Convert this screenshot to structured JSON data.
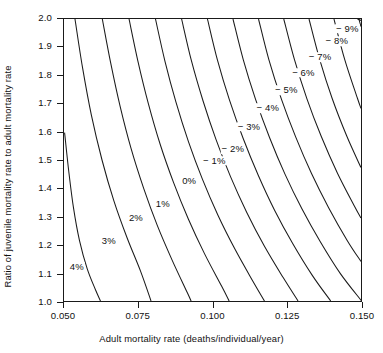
{
  "chart_data": {
    "type": "line",
    "subtype": "contour",
    "title": "",
    "xlabel": "Adult mortality rate (deaths/individual/year)",
    "ylabel": "Ratio of juvenile mortality rate to adult mortality rate",
    "xlim": [
      0.05,
      0.15
    ],
    "ylim": [
      1.0,
      2.0
    ],
    "grid": false,
    "legend": "none",
    "xticks": [
      "0.050",
      "0.075",
      "0.100",
      "0.125",
      "0.150"
    ],
    "xtick_values": [
      0.05,
      0.075,
      0.1,
      0.125,
      0.15
    ],
    "yticks": [
      "1.0",
      "1.1",
      "1.2",
      "1.3",
      "1.4",
      "1.5",
      "1.6",
      "1.7",
      "1.8",
      "1.9",
      "2.0"
    ],
    "ytick_values": [
      1.0,
      1.1,
      1.2,
      1.3,
      1.4,
      1.5,
      1.6,
      1.7,
      1.8,
      1.9,
      2.0
    ],
    "contour_levels": [
      4,
      3,
      2,
      1,
      0,
      -1,
      -2,
      -3,
      -4,
      -5,
      -6,
      -7,
      -8,
      -9
    ],
    "contour_unit": "%",
    "line_color": "#1a1a1a",
    "axis_color": "#1a1a1a",
    "background_color": "#ffffff",
    "contours": [
      {
        "level": 4,
        "label": "4%",
        "label_x": 0.0546,
        "label_y": 1.125,
        "label_side": "right",
        "points": [
          [
            0.0502,
            1.597
          ],
          [
            0.0516,
            1.46
          ],
          [
            0.0532,
            1.33
          ],
          [
            0.0552,
            1.215
          ],
          [
            0.0578,
            1.115
          ],
          [
            0.0606,
            1.04
          ],
          [
            0.0623,
            1.0
          ]
        ]
      },
      {
        "level": 3,
        "label": "3%",
        "label_x": 0.0653,
        "label_y": 1.215,
        "label_side": "right",
        "points": [
          [
            0.0537,
            2.0
          ],
          [
            0.0562,
            1.83
          ],
          [
            0.0592,
            1.66
          ],
          [
            0.0628,
            1.5
          ],
          [
            0.0668,
            1.355
          ],
          [
            0.0712,
            1.225
          ],
          [
            0.0758,
            1.105
          ],
          [
            0.0793,
            1.0
          ]
        ]
      },
      {
        "level": 2,
        "label": "2%",
        "label_x": 0.0744,
        "label_y": 1.295,
        "label_side": "right",
        "points": [
          [
            0.0629,
            2.0
          ],
          [
            0.0657,
            1.845
          ],
          [
            0.0689,
            1.69
          ],
          [
            0.0726,
            1.54
          ],
          [
            0.0768,
            1.4
          ],
          [
            0.0814,
            1.268
          ],
          [
            0.0864,
            1.145
          ],
          [
            0.0915,
            1.03
          ],
          [
            0.0928,
            1.0
          ]
        ]
      },
      {
        "level": 1,
        "label": "1%",
        "label_x": 0.0834,
        "label_y": 1.345,
        "label_side": "right",
        "points": [
          [
            0.0719,
            2.0
          ],
          [
            0.0749,
            1.85
          ],
          [
            0.0784,
            1.7
          ],
          [
            0.0824,
            1.555
          ],
          [
            0.0869,
            1.42
          ],
          [
            0.0919,
            1.29
          ],
          [
            0.0973,
            1.168
          ],
          [
            0.1031,
            1.052
          ],
          [
            0.1056,
            1.0
          ]
        ]
      },
      {
        "level": 0,
        "label": "0%",
        "label_x": 0.0922,
        "label_y": 1.425,
        "label_side": "right",
        "points": [
          [
            0.0808,
            2.0
          ],
          [
            0.084,
            1.85
          ],
          [
            0.0877,
            1.705
          ],
          [
            0.0919,
            1.565
          ],
          [
            0.0966,
            1.432
          ],
          [
            0.1018,
            1.305
          ],
          [
            0.1075,
            1.185
          ],
          [
            0.1136,
            1.07
          ],
          [
            0.1175,
            1.0
          ]
        ]
      },
      {
        "level": -1,
        "label": "− 1%",
        "label_x": 0.1006,
        "label_y": 1.497,
        "label_side": "left",
        "points": [
          [
            0.0896,
            2.0
          ],
          [
            0.0929,
            1.852
          ],
          [
            0.0968,
            1.71
          ],
          [
            0.1012,
            1.572
          ],
          [
            0.1061,
            1.44
          ],
          [
            0.1115,
            1.315
          ],
          [
            0.1174,
            1.196
          ],
          [
            0.1238,
            1.083
          ],
          [
            0.1288,
            1.0
          ]
        ]
      },
      {
        "level": -2,
        "label": "− 2%",
        "label_x": 0.1068,
        "label_y": 1.538,
        "label_side": "left",
        "points": [
          [
            0.0983,
            2.0
          ],
          [
            0.1017,
            1.853
          ],
          [
            0.1057,
            1.713
          ],
          [
            0.1103,
            1.577
          ],
          [
            0.1154,
            1.446
          ],
          [
            0.1209,
            1.322
          ],
          [
            0.127,
            1.204
          ],
          [
            0.1336,
            1.091
          ],
          [
            0.1398,
            1.0
          ]
        ]
      },
      {
        "level": -3,
        "label": "− 3%",
        "label_x": 0.1122,
        "label_y": 1.617,
        "label_side": "left",
        "points": [
          [
            0.1069,
            2.0
          ],
          [
            0.1104,
            1.854
          ],
          [
            0.1145,
            1.715
          ],
          [
            0.1192,
            1.58
          ],
          [
            0.1244,
            1.45
          ],
          [
            0.1301,
            1.327
          ],
          [
            0.1363,
            1.21
          ],
          [
            0.143,
            1.098
          ],
          [
            0.1502,
            1.0
          ]
        ]
      },
      {
        "level": -4,
        "label": "− 4%",
        "label_x": 0.1185,
        "label_y": 1.682,
        "label_side": "left",
        "points": [
          [
            0.1155,
            2.0
          ],
          [
            0.119,
            1.855
          ],
          [
            0.1232,
            1.716
          ],
          [
            0.128,
            1.582
          ],
          [
            0.1333,
            1.453
          ],
          [
            0.1391,
            1.331
          ],
          [
            0.1454,
            1.214
          ],
          [
            0.15,
            1.14
          ]
        ]
      },
      {
        "level": -5,
        "label": "− 5%",
        "label_x": 0.1247,
        "label_y": 1.745,
        "label_side": "left",
        "points": [
          [
            0.124,
            2.0
          ],
          [
            0.1276,
            1.856
          ],
          [
            0.1318,
            1.717
          ],
          [
            0.1366,
            1.584
          ],
          [
            0.142,
            1.455
          ],
          [
            0.1479,
            1.334
          ],
          [
            0.15,
            1.294
          ]
        ]
      },
      {
        "level": -6,
        "label": "− 6%",
        "label_x": 0.1304,
        "label_y": 1.807,
        "label_side": "left",
        "points": [
          [
            0.1325,
            2.0
          ],
          [
            0.1361,
            1.856
          ],
          [
            0.1403,
            1.718
          ],
          [
            0.1452,
            1.585
          ],
          [
            0.15,
            1.473
          ]
        ]
      },
      {
        "level": -7,
        "label": "− 7%",
        "label_x": 0.136,
        "label_y": 1.862,
        "label_side": "left",
        "points": [
          [
            0.1409,
            2.0
          ],
          [
            0.1445,
            1.857
          ],
          [
            0.1488,
            1.719
          ],
          [
            0.15,
            1.683
          ]
        ]
      },
      {
        "level": -8,
        "label": "− 8%",
        "label_x": 0.1416,
        "label_y": 1.918,
        "label_side": "left",
        "points": [
          [
            0.1493,
            2.0
          ],
          [
            0.15,
            1.973
          ]
        ]
      },
      {
        "level": -9,
        "label": "− 9%",
        "label_x": 0.1451,
        "label_y": 1.963,
        "label_side": "left",
        "points": [
          [
            0.1488,
            2.0
          ],
          [
            0.15,
            1.995
          ]
        ]
      }
    ]
  }
}
